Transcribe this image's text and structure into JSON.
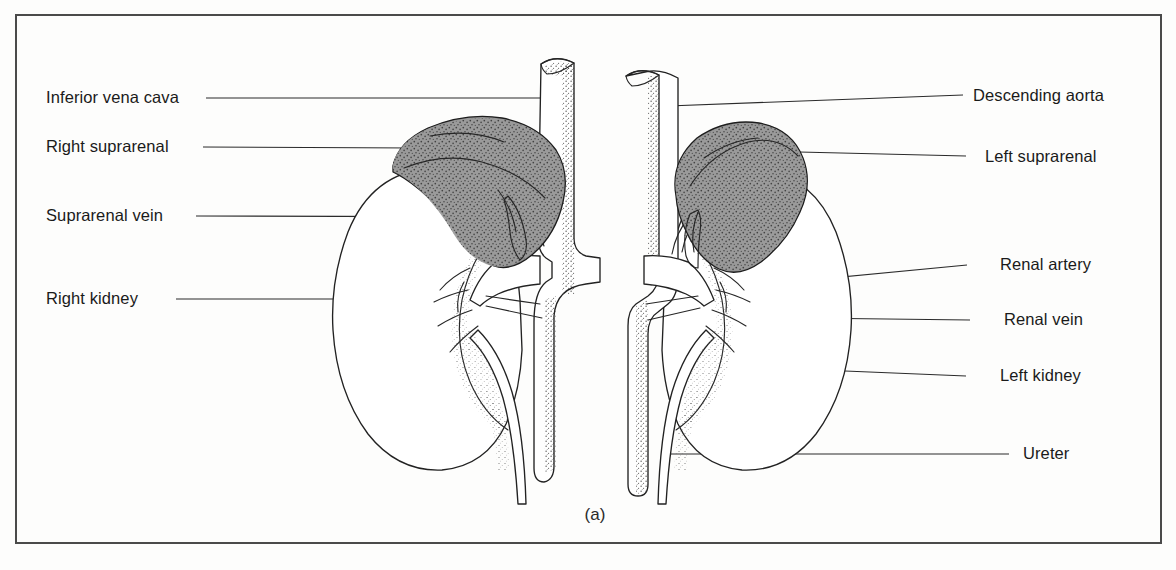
{
  "figure": {
    "caption": "(a)",
    "title_hidden": "",
    "background_color": "#fdfdfc",
    "frame_color": "#4a4a4a",
    "ink_color": "#222222",
    "gland_fill_color": "#9a9a9a",
    "gland_stipple_color": "#3c3c3c",
    "organ_fill_color": "#ffffff"
  },
  "labels_left": [
    {
      "id": "inferior-vena-cava",
      "text": "Inferior vena cava",
      "x": 46,
      "y": 103
    },
    {
      "id": "right-suprarenal",
      "text": "Right suprarenal",
      "x": 46,
      "y": 152
    },
    {
      "id": "suprarenal-vein",
      "text": "Suprarenal vein",
      "x": 46,
      "y": 221
    },
    {
      "id": "right-kidney",
      "text": "Right kidney",
      "x": 46,
      "y": 304
    }
  ],
  "labels_right": [
    {
      "id": "descending-aorta",
      "text": "Descending aorta",
      "x": 973,
      "y": 101
    },
    {
      "id": "left-suprarenal",
      "text": "Left suprarenal",
      "x": 985,
      "y": 162
    },
    {
      "id": "renal-artery",
      "text": "Renal artery",
      "x": 1000,
      "y": 270
    },
    {
      "id": "renal-vein",
      "text": "Renal vein",
      "x": 1004,
      "y": 325
    },
    {
      "id": "left-kidney",
      "text": "Left kidney",
      "x": 1000,
      "y": 381
    },
    {
      "id": "ureter",
      "text": "Ureter",
      "x": 1023,
      "y": 459
    }
  ],
  "leaders": [
    {
      "id": "leader-inferior-vena-cava",
      "path": "M 206 98 L 553 98 L 553 70"
    },
    {
      "id": "leader-right-suprarenal",
      "path": "M 203 147 L 413 147"
    },
    {
      "id": "leader-suprarenal-vein",
      "path": "M 196 216 L 527 216"
    },
    {
      "id": "leader-right-kidney",
      "path": "M 176 299 L 348 299"
    },
    {
      "id": "leader-descending-aorta",
      "path": "M 963 95 L 668 106"
    },
    {
      "id": "leader-left-suprarenal",
      "path": "M 966 156 L 800 152"
    },
    {
      "id": "leader-renal-artery",
      "path": "M 967 265 L 727 287"
    },
    {
      "id": "leader-renal-vein",
      "path": "M 970 320 L 718 317"
    },
    {
      "id": "leader-left-kidney",
      "path": "M 966 376 L 846 371"
    },
    {
      "id": "leader-ureter",
      "path": "M 1009 454 L 672 454"
    }
  ],
  "organs": [
    {
      "id": "right-kidney-shape",
      "name": "right kidney"
    },
    {
      "id": "left-kidney-shape",
      "name": "left kidney"
    },
    {
      "id": "right-suprarenal-gland",
      "name": "right suprarenal gland"
    },
    {
      "id": "left-suprarenal-gland",
      "name": "left suprarenal gland"
    },
    {
      "id": "inferior-vena-cava-vessel",
      "name": "inferior vena cava"
    },
    {
      "id": "descending-aorta-vessel",
      "name": "descending aorta"
    },
    {
      "id": "right-ureter-tube",
      "name": "right ureter"
    },
    {
      "id": "left-ureter-tube",
      "name": "left ureter"
    }
  ]
}
